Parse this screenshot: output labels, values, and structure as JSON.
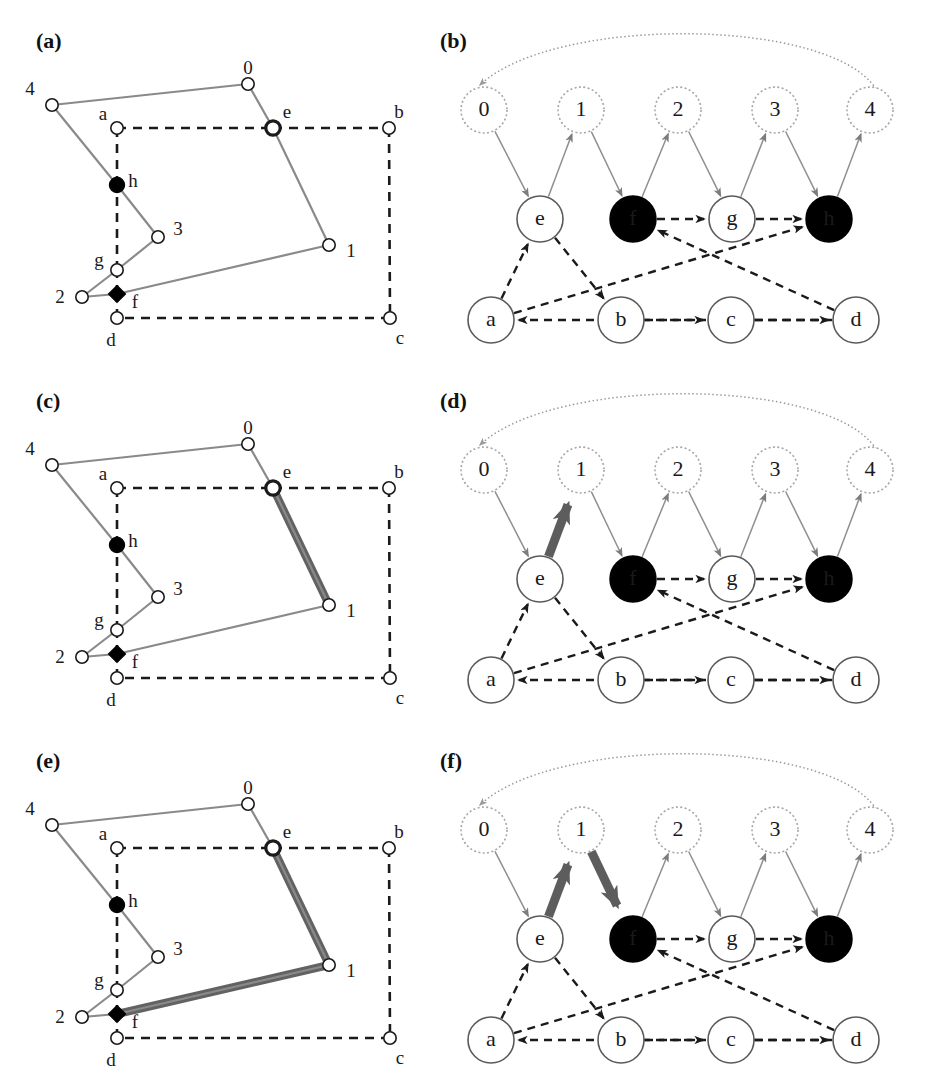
{
  "figure": {
    "width": 925,
    "height": 1081,
    "background": "#ffffff"
  },
  "colors": {
    "ink": "#1a1a1a",
    "light_gray_edge": "#8a8a8a",
    "dotted_outline": "#9a9a9a",
    "highlight_gray": "#555555",
    "fill_black": "#000000",
    "fill_white": "#ffffff"
  },
  "panels": [
    {
      "id": "a",
      "label": "(a)",
      "type": "polygon",
      "x": 36,
      "y": 28
    },
    {
      "id": "b",
      "label": "(b)",
      "type": "graph",
      "x": 440,
      "y": 28
    },
    {
      "id": "c",
      "label": "(c)",
      "type": "polygon",
      "x": 36,
      "y": 388
    },
    {
      "id": "d",
      "label": "(d)",
      "type": "graph",
      "x": 440,
      "y": 388
    },
    {
      "id": "e",
      "label": "(e)",
      "type": "polygon",
      "x": 36,
      "y": 748
    },
    {
      "id": "f",
      "label": "(f)",
      "type": "graph",
      "x": 440,
      "y": 748
    }
  ],
  "polygon": {
    "vertices": [
      {
        "id": "0",
        "label": "0",
        "x": 248,
        "y": 84,
        "style": "open",
        "label_dx": 0,
        "label_dy": -14
      },
      {
        "id": "1",
        "label": "1",
        "x": 329,
        "y": 245,
        "style": "open",
        "label_dx": 22,
        "label_dy": 8
      },
      {
        "id": "2",
        "label": "2",
        "x": 82,
        "y": 297,
        "style": "open",
        "label_dx": -22,
        "label_dy": 2
      },
      {
        "id": "3",
        "label": "3",
        "x": 158,
        "y": 237,
        "style": "open",
        "label_dx": 20,
        "label_dy": -6
      },
      {
        "id": "4",
        "label": "4",
        "x": 52,
        "y": 105,
        "style": "open",
        "label_dx": -22,
        "label_dy": -14
      },
      {
        "id": "a",
        "label": "a",
        "x": 117,
        "y": 128,
        "style": "open",
        "label_dx": -14,
        "label_dy": -12
      },
      {
        "id": "b",
        "label": "b",
        "x": 389,
        "y": 128,
        "style": "open",
        "label_dx": 10,
        "label_dy": -14
      },
      {
        "id": "c",
        "label": "c",
        "x": 390,
        "y": 318,
        "style": "open",
        "label_dx": 10,
        "label_dy": 22
      },
      {
        "id": "d",
        "label": "d",
        "x": 117,
        "y": 318,
        "style": "open",
        "label_dx": -6,
        "label_dy": 24
      },
      {
        "id": "e",
        "label": "e",
        "x": 273,
        "y": 128,
        "style": "bold",
        "label_dx": 14,
        "label_dy": -14
      },
      {
        "id": "f",
        "label": "f",
        "x": 117,
        "y": 294,
        "style": "filled-diamond",
        "label_dx": 18,
        "label_dy": 10
      },
      {
        "id": "g",
        "label": "g",
        "x": 117,
        "y": 270,
        "style": "open",
        "label_dx": -18,
        "label_dy": -8
      },
      {
        "id": "h",
        "label": "h",
        "x": 117,
        "y": 185,
        "style": "filled",
        "label_dx": 16,
        "label_dy": -2
      }
    ],
    "solid_chain": [
      [
        "4",
        "0"
      ],
      [
        "0",
        "e"
      ],
      [
        "e",
        "1"
      ],
      [
        "1",
        "f"
      ],
      [
        "f",
        "2"
      ],
      [
        "2",
        "g"
      ],
      [
        "g",
        "3"
      ],
      [
        "3",
        "h"
      ],
      [
        "h",
        "4"
      ]
    ],
    "dashed_chain": [
      [
        "a",
        "e"
      ],
      [
        "e",
        "b"
      ],
      [
        "b",
        "c"
      ],
      [
        "c",
        "d"
      ],
      [
        "d",
        "f"
      ],
      [
        "f",
        "g"
      ],
      [
        "g",
        "h"
      ],
      [
        "h",
        "a"
      ]
    ],
    "highlight_sets": {
      "a": [],
      "c": [
        [
          "e",
          "1"
        ]
      ],
      "e": [
        [
          "e",
          "1"
        ],
        [
          "1",
          "f"
        ]
      ]
    }
  },
  "graph": {
    "rows": {
      "top_label": "reflex / split vertices",
      "middle_label": "chain nodes",
      "bottom_label": "boundary nodes"
    },
    "nodes": [
      {
        "id": "0",
        "label": "0",
        "x": 484,
        "y": 110,
        "row": "top",
        "fill": "white",
        "outline": "dotted"
      },
      {
        "id": "1",
        "label": "1",
        "x": 581,
        "y": 110,
        "row": "top",
        "fill": "white",
        "outline": "dotted"
      },
      {
        "id": "2",
        "label": "2",
        "x": 678,
        "y": 110,
        "row": "top",
        "fill": "white",
        "outline": "dotted"
      },
      {
        "id": "3",
        "label": "3",
        "x": 775,
        "y": 110,
        "row": "top",
        "fill": "white",
        "outline": "dotted"
      },
      {
        "id": "4",
        "label": "4",
        "x": 870,
        "y": 110,
        "row": "top",
        "fill": "white",
        "outline": "dotted"
      },
      {
        "id": "e",
        "label": "e",
        "x": 540,
        "y": 219,
        "row": "middle",
        "fill": "white",
        "outline": "solid"
      },
      {
        "id": "f",
        "label": "f",
        "x": 633,
        "y": 219,
        "row": "middle",
        "fill": "black",
        "outline": "solid"
      },
      {
        "id": "g",
        "label": "g",
        "x": 732,
        "y": 219,
        "row": "middle",
        "fill": "white",
        "outline": "solid"
      },
      {
        "id": "h",
        "label": "h",
        "x": 829,
        "y": 219,
        "row": "middle",
        "fill": "black",
        "outline": "solid"
      },
      {
        "id": "a",
        "label": "a",
        "x": 491,
        "y": 320,
        "row": "bottom",
        "fill": "white",
        "outline": "solid"
      },
      {
        "id": "b",
        "label": "b",
        "x": 621,
        "y": 320,
        "row": "bottom",
        "fill": "white",
        "outline": "solid"
      },
      {
        "id": "c",
        "label": "c",
        "x": 731,
        "y": 320,
        "row": "bottom",
        "fill": "white",
        "outline": "solid"
      },
      {
        "id": "d",
        "label": "d",
        "x": 856,
        "y": 320,
        "row": "bottom",
        "fill": "white",
        "outline": "solid"
      }
    ],
    "thin_edges": [
      {
        "from": "0",
        "to": "e"
      },
      {
        "from": "e",
        "to": "1"
      },
      {
        "from": "1",
        "to": "f"
      },
      {
        "from": "f",
        "to": "2"
      },
      {
        "from": "2",
        "to": "g"
      },
      {
        "from": "g",
        "to": "3"
      },
      {
        "from": "3",
        "to": "h"
      },
      {
        "from": "h",
        "to": "4"
      }
    ],
    "dashed_edges": [
      {
        "from": "a",
        "to": "e"
      },
      {
        "from": "e",
        "to": "b"
      },
      {
        "from": "b",
        "to": "c"
      },
      {
        "from": "c",
        "to": "d"
      },
      {
        "from": "d",
        "to": "f"
      },
      {
        "from": "f",
        "to": "g"
      },
      {
        "from": "g",
        "to": "h"
      },
      {
        "from": "d",
        "to": "a"
      },
      {
        "from": "a",
        "to": "h"
      }
    ],
    "arc_edge": {
      "from": "4",
      "to": "0",
      "label": "wrap-around arc"
    },
    "highlight_sets": {
      "b": [],
      "d": [
        [
          "e",
          "1"
        ]
      ],
      "f": [
        [
          "e",
          "1"
        ],
        [
          "1",
          "f"
        ]
      ]
    }
  }
}
